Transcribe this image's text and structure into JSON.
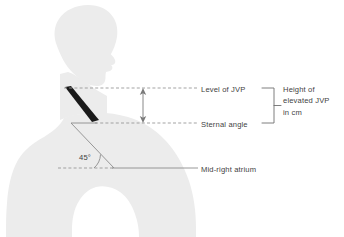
{
  "diagram": {
    "background_color": "#ffffff",
    "body_color": "#ececec",
    "line_color": "#8c8c8c",
    "vein_color": "#1a1a1a",
    "text_color": "#3f3f3f"
  },
  "labels": {
    "level_of_jvp": "Level of JVP",
    "sternal_angle": "Sternal angle",
    "mid_right_atrium": "Mid-right atrium",
    "angle_value": "45°",
    "height_line1": "Height of",
    "height_line2": "elevated JVP",
    "height_line3": "in cm"
  },
  "measurements": {
    "patient_recline_angle_degrees": 45,
    "jvp_height_units": "cm"
  },
  "elements": {
    "body_silhouette": "human-profile-silhouette",
    "jugular_vein": "distended-jugular-vein-marker",
    "height_arrow": "double-headed-vertical-arrow",
    "jvp_dashed_line": "horizontal-dashed-reference-line",
    "sternal_dashed_line": "horizontal-dashed-reference-line",
    "atrium_dashed_line": "horizontal-dashed-reference-line",
    "recline_line": "forty-five-degree-torso-line",
    "angle_arc": "angle-arc-indicator",
    "bracket": "right-facing-span-bracket"
  }
}
